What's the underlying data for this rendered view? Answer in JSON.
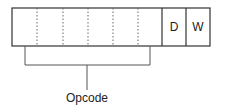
{
  "diagram": {
    "fields": [
      {
        "name": "opcode-bit-1",
        "label": ""
      },
      {
        "name": "opcode-bit-2",
        "label": ""
      },
      {
        "name": "opcode-bit-3",
        "label": ""
      },
      {
        "name": "opcode-bit-4",
        "label": ""
      },
      {
        "name": "opcode-bit-5",
        "label": ""
      },
      {
        "name": "opcode-bit-6",
        "label": ""
      },
      {
        "name": "d-bit",
        "label": "D"
      },
      {
        "name": "w-bit",
        "label": "W"
      }
    ],
    "bracket_label": "Opcode"
  }
}
